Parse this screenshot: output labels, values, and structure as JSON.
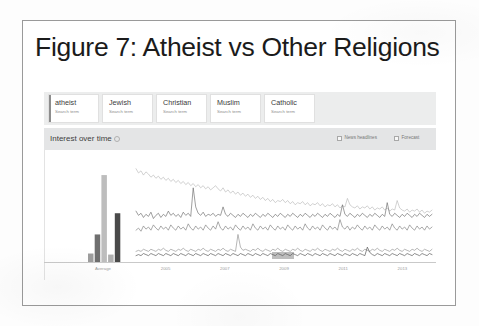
{
  "figure": {
    "title": "Figure 7: Atheist vs Other Religions"
  },
  "trends": {
    "search_terms": [
      {
        "term": "atheist",
        "subtitle": "Search term",
        "active": true,
        "color": "#6f6f6f"
      },
      {
        "term": "Jewish",
        "subtitle": "Search term",
        "active": false,
        "color": "#565656"
      },
      {
        "term": "Christian",
        "subtitle": "Search term",
        "active": false,
        "color": "#b4b4b4"
      },
      {
        "term": "Muslim",
        "subtitle": "Search term",
        "active": false,
        "color": "#8a8a8a"
      },
      {
        "term": "Catholic",
        "subtitle": "Search term",
        "active": false,
        "color": "#3f3f3f"
      }
    ],
    "section": {
      "heading": "Interest over time",
      "info_icon": "info-icon"
    },
    "toggles": [
      {
        "id": "news-headlines",
        "label": "News headlines",
        "checked": false
      },
      {
        "id": "forecast",
        "label": "Forecast",
        "checked": false
      }
    ]
  },
  "chart_data": {
    "type": "line",
    "title": "Interest over time",
    "xlabel": "",
    "ylabel": "Search interest",
    "ylim": [
      0,
      100
    ],
    "grid": false,
    "legend": "top-chips",
    "average_axis_label": "Average",
    "x_tick_labels": [
      "2005",
      "2007",
      "2009",
      "2011",
      "2013"
    ],
    "average_bars": {
      "categories": [
        "atheist",
        "Jewish",
        "Christian",
        "Muslim",
        "Catholic"
      ],
      "values": [
        8,
        26,
        82,
        7,
        46
      ],
      "colors": [
        "#9d9d9d",
        "#6f6f6f",
        "#bdbdbd",
        "#b0b0b0",
        "#4a4a4a"
      ]
    },
    "series": [
      {
        "name": "Christian",
        "color": "#b9b9b9",
        "values": [
          88,
          84,
          86,
          82,
          85,
          83,
          80,
          82,
          79,
          81,
          78,
          80,
          77,
          79,
          76,
          78,
          75,
          77,
          74,
          76,
          73,
          75,
          72,
          74,
          71,
          73,
          70,
          72,
          69,
          71,
          68,
          70,
          72,
          69,
          67,
          70,
          66,
          68,
          65,
          67,
          64,
          66,
          63,
          65,
          62,
          64,
          61,
          63,
          60,
          62,
          59,
          61,
          58,
          60,
          57,
          59,
          56,
          58,
          57,
          59,
          56,
          58,
          55,
          57,
          54,
          56,
          55,
          57,
          54,
          56,
          53,
          55,
          54,
          56,
          53,
          55,
          52,
          54,
          53,
          55,
          52,
          54,
          51,
          53,
          52,
          60,
          54,
          52,
          51,
          53,
          50,
          52,
          51,
          53,
          50,
          52,
          49,
          51,
          50,
          52,
          49,
          51,
          48,
          50,
          49,
          58,
          51,
          49,
          48,
          50,
          47,
          49,
          48,
          50,
          47,
          49,
          46,
          48,
          47,
          49
        ]
      },
      {
        "name": "Jewish",
        "color": "#6b6b6b",
        "values": [
          48,
          44,
          46,
          42,
          45,
          43,
          47,
          41,
          44,
          46,
          42,
          45,
          43,
          48,
          44,
          46,
          43,
          45,
          42,
          47,
          44,
          46,
          43,
          70,
          52,
          46,
          44,
          47,
          43,
          45,
          44,
          46,
          43,
          45,
          44,
          52,
          45,
          43,
          46,
          44,
          42,
          45,
          43,
          46,
          44,
          42,
          45,
          43,
          46,
          44,
          42,
          45,
          43,
          46,
          44,
          42,
          45,
          43,
          46,
          44,
          42,
          45,
          43,
          46,
          44,
          42,
          45,
          43,
          46,
          44,
          42,
          45,
          43,
          46,
          44,
          42,
          45,
          43,
          46,
          44,
          42,
          45,
          43,
          54,
          45,
          43,
          46,
          44,
          42,
          45,
          43,
          46,
          44,
          42,
          45,
          43,
          46,
          44,
          42,
          45,
          43,
          56,
          45,
          43,
          46,
          44,
          42,
          45,
          43,
          46,
          44,
          42,
          45,
          43,
          46,
          44,
          42,
          45,
          43,
          45
        ]
      },
      {
        "name": "Muslim",
        "color": "#7d7d7d",
        "values": [
          30,
          32,
          29,
          34,
          31,
          33,
          30,
          35,
          32,
          30,
          34,
          31,
          33,
          30,
          35,
          32,
          30,
          34,
          31,
          33,
          30,
          36,
          32,
          30,
          34,
          31,
          33,
          30,
          35,
          32,
          30,
          34,
          31,
          38,
          32,
          30,
          34,
          31,
          33,
          30,
          35,
          32,
          30,
          34,
          31,
          33,
          30,
          36,
          32,
          30,
          34,
          31,
          33,
          30,
          35,
          32,
          30,
          34,
          31,
          33,
          30,
          35,
          32,
          30,
          34,
          31,
          33,
          30,
          36,
          32,
          30,
          34,
          31,
          33,
          30,
          35,
          32,
          30,
          34,
          31,
          33,
          30,
          40,
          33,
          31,
          34,
          30,
          33,
          31,
          35,
          32,
          30,
          34,
          31,
          33,
          30,
          35,
          32,
          30,
          34,
          31,
          33,
          30,
          36,
          32,
          30,
          34,
          31,
          33,
          30,
          35,
          32,
          30,
          34,
          31,
          33,
          30,
          34,
          31,
          33
        ]
      },
      {
        "name": "atheist",
        "color": "#8f8f8f",
        "values": [
          10,
          11,
          10,
          12,
          11,
          10,
          12,
          11,
          10,
          12,
          11,
          13,
          11,
          10,
          12,
          11,
          10,
          12,
          11,
          13,
          11,
          10,
          12,
          11,
          10,
          12,
          11,
          13,
          11,
          10,
          12,
          11,
          10,
          12,
          11,
          13,
          11,
          10,
          12,
          11,
          10,
          26,
          14,
          11,
          12,
          11,
          10,
          12,
          11,
          13,
          11,
          10,
          12,
          11,
          10,
          12,
          11,
          13,
          11,
          10,
          12,
          11,
          10,
          12,
          11,
          13,
          11,
          10,
          12,
          11,
          10,
          12,
          11,
          13,
          11,
          10,
          12,
          11,
          10,
          12,
          11,
          13,
          11,
          10,
          12,
          11,
          10,
          12,
          11,
          13,
          11,
          10,
          12,
          11,
          10,
          12,
          11,
          13,
          11,
          10,
          12,
          11,
          10,
          12,
          11,
          13,
          11,
          10,
          12,
          11,
          10,
          12,
          11,
          13,
          11,
          10,
          12,
          11,
          10,
          12
        ]
      },
      {
        "name": "Catholic",
        "color": "#4f4f4f",
        "values": [
          6,
          7,
          6,
          8,
          7,
          6,
          8,
          7,
          6,
          8,
          7,
          6,
          8,
          7,
          6,
          8,
          7,
          6,
          8,
          7,
          6,
          8,
          7,
          6,
          8,
          7,
          6,
          8,
          7,
          6,
          8,
          7,
          6,
          8,
          7,
          6,
          8,
          7,
          6,
          8,
          7,
          6,
          8,
          7,
          6,
          8,
          7,
          6,
          8,
          7,
          6,
          8,
          7,
          6,
          8,
          7,
          6,
          8,
          7,
          6,
          8,
          7,
          6,
          8,
          7,
          6,
          8,
          7,
          6,
          8,
          7,
          6,
          8,
          7,
          6,
          8,
          7,
          6,
          8,
          7,
          6,
          8,
          7,
          6,
          8,
          7,
          6,
          8,
          7,
          6,
          8,
          7,
          6,
          14,
          9,
          7,
          6,
          8,
          7,
          6,
          8,
          7,
          6,
          8,
          7,
          6,
          8,
          7,
          6,
          8,
          7,
          6,
          8,
          7,
          6,
          8,
          7,
          6,
          8,
          7
        ]
      }
    ]
  }
}
